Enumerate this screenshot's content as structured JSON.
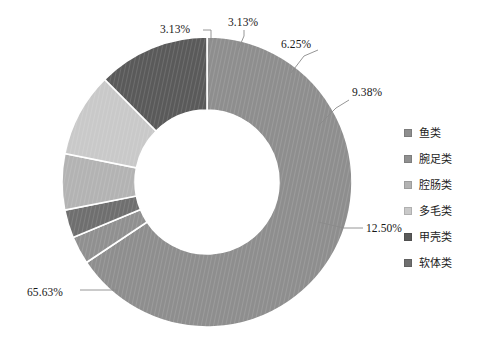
{
  "chart_data": {
    "type": "pie",
    "variant": "donut",
    "title": "",
    "subtitle": "",
    "xlabel": "",
    "ylabel": "",
    "units": "percent",
    "legend_position": "right",
    "grid": false,
    "start_angle_deg": 0,
    "direction": "clockwise",
    "center": {
      "x": 207,
      "y": 182
    },
    "outer_radius": 145,
    "inner_radius": 72,
    "categories": [
      "鱼类",
      "腕足类",
      "腔肠类",
      "多毛类",
      "甲壳类",
      "软体类"
    ],
    "values": [
      65.63,
      3.13,
      3.13,
      6.25,
      9.38,
      12.5
    ],
    "labels": [
      "65.63%",
      "3.13%",
      "3.13%",
      "6.25%",
      "9.38%",
      "12.50%"
    ],
    "colors": [
      "#8e8e8e",
      "#909090",
      "#6f6f6f",
      "#b3b3b3",
      "#c9c9c9",
      "#5a5a5a"
    ],
    "slices": [
      {
        "name": "鱼类",
        "value": 65.63,
        "label": "65.63%",
        "color": "#8e8e8e",
        "start_deg": 0,
        "end_deg": 236.268,
        "label_x": 27,
        "label_y": 296,
        "leader": "M 118,290 L 98,290 L 80,290"
      },
      {
        "name": "腕足类",
        "value": 3.13,
        "label": "3.13%",
        "color": "#909090",
        "start_deg": 236.268,
        "end_deg": 247.536,
        "label_x": 160,
        "label_y": 33,
        "leader": "M 211,41 L 211,30 L 203,30"
      },
      {
        "name": "腔肠类",
        "value": 3.13,
        "label": "3.13%",
        "color": "#6f6f6f",
        "start_deg": 247.536,
        "end_deg": 258.804,
        "label_x": 228,
        "label_y": 26,
        "leader": "M 238,50 L 244,36 L 244,30"
      },
      {
        "name": "多毛类",
        "value": 6.25,
        "label": "6.25%",
        "color": "#b3b3b3",
        "start_deg": 258.804,
        "end_deg": 281.304,
        "label_x": 281,
        "label_y": 48,
        "leader": "M 291,73 L 304,56 L 318,50"
      },
      {
        "name": "甲壳类",
        "value": 9.38,
        "label": "9.38%",
        "color": "#c9c9c9",
        "start_deg": 281.304,
        "end_deg": 315.072,
        "label_x": 352,
        "label_y": 96,
        "leader": "M 318,126 L 336,108 L 349,100"
      },
      {
        "name": "软体类",
        "value": 12.5,
        "label": "12.50%",
        "color": "#5a5a5a",
        "start_deg": 315.072,
        "end_deg": 360,
        "label_x": 366,
        "label_y": 232,
        "leader": "M 318,222 L 344,228 L 363,228"
      }
    ]
  },
  "legend": {
    "items": [
      {
        "label": "鱼类",
        "color": "#8e8e8e"
      },
      {
        "label": "腕足类",
        "color": "#909090"
      },
      {
        "label": "腔肠类",
        "color": "#b3b3b3"
      },
      {
        "label": "多毛类",
        "color": "#c9c9c9"
      },
      {
        "label": "甲壳类",
        "color": "#5a5a5a"
      },
      {
        "label": "软体类",
        "color": "#6f6f6f"
      }
    ]
  }
}
